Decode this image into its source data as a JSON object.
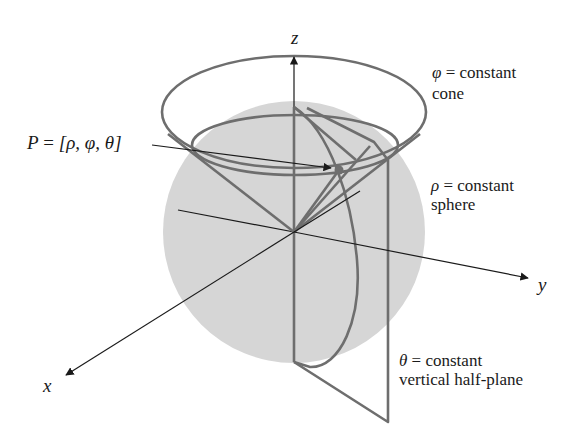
{
  "figure": {
    "colors": {
      "sphere_fill": "#d6d6d6",
      "surface_stroke": "#6e6e6e",
      "axis_stroke": "#1a1a1a",
      "text": "#1a1a1a",
      "background": "#ffffff"
    }
  },
  "axes": {
    "x_label": "x",
    "y_label": "y",
    "z_label": "z"
  },
  "point": {
    "label_lhs": "P",
    "label_eq": "=",
    "label_coords": "[ρ, φ, θ]"
  },
  "annotations": {
    "cone": {
      "symbol": "φ",
      "equation": "= constant",
      "name": "cone"
    },
    "sphere": {
      "symbol": "ρ",
      "equation": "= constant",
      "name": "sphere"
    },
    "half_plane": {
      "symbol": "θ",
      "equation": "= constant",
      "name": "vertical half-plane"
    }
  }
}
